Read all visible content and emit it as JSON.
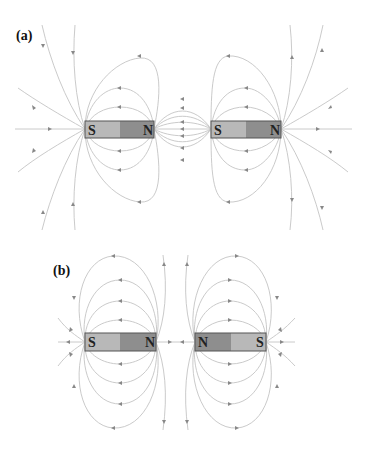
{
  "figure": {
    "panel_a": {
      "label": "(a)",
      "description": "Two bar magnets aligned S-N, S-N (attracting configuration)",
      "magnets": [
        {
          "left_pole": "S",
          "right_pole": "N"
        },
        {
          "left_pole": "S",
          "right_pole": "N"
        }
      ]
    },
    "panel_b": {
      "label": "(b)",
      "description": "Two bar magnets aligned S-N, N-S (repelling configuration)",
      "magnets": [
        {
          "left_pole": "S",
          "right_pole": "N"
        },
        {
          "left_pole": "N",
          "right_pole": "S"
        }
      ]
    },
    "colors": {
      "magnet_light": "#b8b8b8",
      "magnet_dark": "#8e8e8e",
      "magnet_border": "#555555",
      "field_line": "#c4c4c4",
      "arrow": "#888888"
    }
  }
}
